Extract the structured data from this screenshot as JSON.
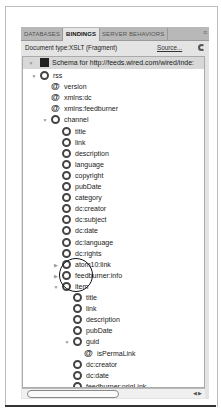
{
  "tabs": [
    {
      "label": "Databases",
      "active": false
    },
    {
      "label": "Bindings",
      "active": true
    },
    {
      "label": "Server Behaviors",
      "active": false
    }
  ],
  "doc_type": "Document type:XSLT (Fragment)",
  "source_link": "Source...",
  "schema_label": "Schema for http://feeds.wired.com/wired/inde:",
  "tree": [
    {
      "label": "rss",
      "type": "element",
      "depth": 1,
      "expanded": true
    },
    {
      "label": "version",
      "type": "attribute",
      "depth": 2
    },
    {
      "label": "xmlns:dc",
      "type": "attribute",
      "depth": 2
    },
    {
      "label": "xmlns:feedburner",
      "type": "attribute",
      "depth": 2
    },
    {
      "label": "channel",
      "type": "element",
      "depth": 2,
      "expanded": true
    },
    {
      "label": "title",
      "type": "element",
      "depth": 3
    },
    {
      "label": "link",
      "type": "element",
      "depth": 3
    },
    {
      "label": "description",
      "type": "element",
      "depth": 3
    },
    {
      "label": "language",
      "type": "element",
      "depth": 3
    },
    {
      "label": "copyright",
      "type": "element",
      "depth": 3
    },
    {
      "label": "pubDate",
      "type": "element",
      "depth": 3
    },
    {
      "label": "category",
      "type": "element",
      "depth": 3
    },
    {
      "label": "dc:creator",
      "type": "element",
      "depth": 3
    },
    {
      "label": "dc:subject",
      "type": "element",
      "depth": 3
    },
    {
      "label": "dc:date",
      "type": "element",
      "depth": 3
    },
    {
      "label": "dc:language",
      "type": "element",
      "depth": 3
    },
    {
      "label": "dc:rights",
      "type": "element",
      "depth": 3
    },
    {
      "label": "atom10:link",
      "type": "repeating",
      "depth": 3,
      "collapsed": true
    },
    {
      "label": "feedburner:info",
      "type": "element",
      "depth": 3,
      "collapsed": true
    },
    {
      "label": "item",
      "type": "repeating",
      "depth": 3,
      "expanded": true
    },
    {
      "label": "title",
      "type": "element",
      "depth": 4
    },
    {
      "label": "link",
      "type": "element",
      "depth": 4
    },
    {
      "label": "description",
      "type": "element",
      "depth": 4
    },
    {
      "label": "pubDate",
      "type": "element",
      "depth": 4
    },
    {
      "label": "guid",
      "type": "element",
      "depth": 4,
      "expanded": true
    },
    {
      "label": "isPermaLink",
      "type": "attribute",
      "depth": 5
    },
    {
      "label": "dc:creator",
      "type": "element",
      "depth": 4
    },
    {
      "label": "dc:date",
      "type": "element",
      "depth": 4
    },
    {
      "label": "feedburner:origLink",
      "type": "element",
      "depth": 4
    }
  ]
}
